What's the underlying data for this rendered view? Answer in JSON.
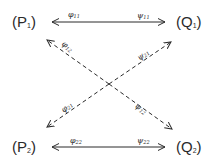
{
  "diagram": {
    "nodes": {
      "p1": {
        "symbol": "P",
        "index": "1"
      },
      "q1": {
        "symbol": "Q",
        "index": "1"
      },
      "p2": {
        "symbol": "P",
        "index": "2"
      },
      "q2": {
        "symbol": "Q",
        "index": "2"
      }
    },
    "edges": {
      "phi11": {
        "symbol": "φ",
        "index": "11",
        "from": "center-top",
        "to": "P1",
        "style": "solid"
      },
      "psi11": {
        "symbol": "ψ",
        "index": "11",
        "from": "center-top",
        "to": "Q1",
        "style": "solid"
      },
      "phi12": {
        "symbol": "φ",
        "index": "12",
        "from": "center",
        "to": "P1",
        "style": "dashed"
      },
      "psi21": {
        "symbol": "ψ",
        "index": "21",
        "from": "center",
        "to": "Q1",
        "style": "dashed"
      },
      "phi21": {
        "symbol": "φ",
        "index": "21",
        "from": "center",
        "to": "P2",
        "style": "dashed"
      },
      "psi12": {
        "symbol": "ψ",
        "index": "12",
        "from": "center",
        "to": "Q2",
        "style": "dashed"
      },
      "phi22": {
        "symbol": "φ",
        "index": "22",
        "from": "center-bottom",
        "to": "P2",
        "style": "solid"
      },
      "psi22": {
        "symbol": "ψ",
        "index": "22",
        "from": "center-bottom",
        "to": "Q2",
        "style": "solid"
      }
    },
    "stroke_color": "#2a2a2a"
  }
}
